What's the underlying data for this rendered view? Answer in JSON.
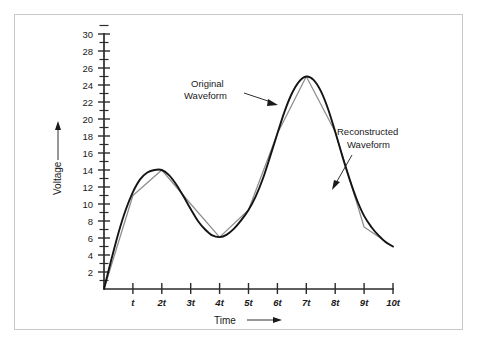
{
  "figure": {
    "background_color": "#ffffff",
    "border_color": "#c9c9c9"
  },
  "chart_data": {
    "type": "line",
    "title": "",
    "xlabel": "Time",
    "ylabel": "Voltage",
    "xlim": [
      0,
      10
    ],
    "ylim": [
      0,
      31
    ],
    "grid": false,
    "legend": "annotations",
    "x_tick_labels": [
      "t",
      "2t",
      "3t",
      "4t",
      "5t",
      "6t",
      "7t",
      "8t",
      "9t",
      "10t"
    ],
    "x_tick_values": [
      1,
      2,
      3,
      4,
      5,
      6,
      7,
      8,
      9,
      10
    ],
    "y_tick_labels": [
      "2",
      "4",
      "6",
      "8",
      "10",
      "12",
      "14",
      "16",
      "18",
      "20",
      "22",
      "24",
      "26",
      "28",
      "30"
    ],
    "y_tick_values": [
      2,
      4,
      6,
      8,
      10,
      12,
      14,
      16,
      18,
      20,
      22,
      24,
      26,
      28,
      30
    ],
    "y_minor_tick_values": [
      1,
      3,
      5,
      7,
      9,
      11,
      13,
      15,
      17,
      19,
      21,
      23,
      25,
      27,
      29,
      31
    ],
    "series": [
      {
        "name": "Original Waveform",
        "style": "smooth-curve",
        "color": "#141414",
        "x": [
          0.0,
          0.25,
          0.5,
          0.75,
          1.0,
          1.25,
          1.5,
          1.75,
          2.0,
          2.25,
          2.5,
          2.75,
          3.0,
          3.25,
          3.5,
          3.75,
          4.0,
          4.25,
          4.5,
          4.75,
          5.0,
          5.25,
          5.5,
          5.75,
          6.0,
          6.25,
          6.5,
          6.75,
          7.0,
          7.25,
          7.5,
          7.75,
          8.0,
          8.25,
          8.5,
          8.75,
          9.0,
          9.25,
          9.5,
          9.75,
          10.0
        ],
        "y": [
          0.0,
          3.4,
          6.6,
          9.3,
          11.4,
          12.9,
          13.7,
          14.0,
          14.0,
          13.4,
          12.3,
          10.9,
          9.4,
          8.0,
          7.0,
          6.3,
          6.1,
          6.4,
          7.1,
          8.1,
          9.3,
          10.9,
          13.0,
          15.6,
          18.3,
          20.9,
          23.0,
          24.4,
          25.0,
          24.6,
          23.3,
          21.2,
          18.5,
          15.6,
          12.9,
          10.5,
          8.6,
          7.3,
          6.3,
          5.5,
          5.0
        ]
      },
      {
        "name": "Reconstructed Waveform",
        "style": "polyline-sampled",
        "color": "#8d8d8d",
        "x": [
          0,
          1,
          2,
          3,
          4,
          5,
          6,
          7,
          8,
          9,
          10
        ],
        "y": [
          0,
          11.0,
          14.0,
          10.0,
          6.1,
          9.3,
          18.3,
          25.0,
          18.5,
          7.3,
          5.0
        ]
      }
    ],
    "annotations": [
      {
        "label_line_1": "Original",
        "label_line_2": "Waveform",
        "points_to_series": "Original Waveform"
      },
      {
        "label_line_1": "Reconstructed",
        "label_line_2": "Waveform",
        "points_to_series": "Reconstructed Waveform"
      }
    ],
    "axis_arrow_x": "right-arrow",
    "axis_arrow_y": "up-arrow"
  }
}
